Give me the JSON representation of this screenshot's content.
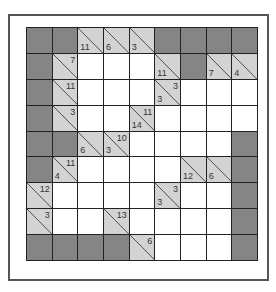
{
  "puzzle": {
    "type": "kakuro",
    "rows": 9,
    "cols": 9,
    "colors": {
      "dark": "#858585",
      "clue": "#d3d3d3",
      "white": "#ffffff",
      "lines": "#222222"
    },
    "grid": [
      [
        {
          "t": "D"
        },
        {
          "t": "D"
        },
        {
          "t": "C",
          "d": "11"
        },
        {
          "t": "C",
          "d": "6"
        },
        {
          "t": "C",
          "d": "3"
        },
        {
          "t": "D"
        },
        {
          "t": "D"
        },
        {
          "t": "D"
        },
        {
          "t": "D"
        }
      ],
      [
        {
          "t": "D"
        },
        {
          "t": "C",
          "r": "7"
        },
        {
          "t": "W"
        },
        {
          "t": "W"
        },
        {
          "t": "W"
        },
        {
          "t": "C",
          "d": "11"
        },
        {
          "t": "D"
        },
        {
          "t": "C",
          "d": "7"
        },
        {
          "t": "C",
          "d": "4"
        }
      ],
      [
        {
          "t": "D"
        },
        {
          "t": "C",
          "r": "11"
        },
        {
          "t": "W"
        },
        {
          "t": "W"
        },
        {
          "t": "W"
        },
        {
          "t": "C",
          "d": "3",
          "r": "3"
        },
        {
          "t": "W"
        },
        {
          "t": "W"
        },
        {
          "t": "W"
        }
      ],
      [
        {
          "t": "D"
        },
        {
          "t": "C",
          "r": "3"
        },
        {
          "t": "W"
        },
        {
          "t": "W"
        },
        {
          "t": "C",
          "d": "14",
          "r": "11"
        },
        {
          "t": "W"
        },
        {
          "t": "W"
        },
        {
          "t": "W"
        },
        {
          "t": "W"
        }
      ],
      [
        {
          "t": "D"
        },
        {
          "t": "D"
        },
        {
          "t": "C",
          "d": "6"
        },
        {
          "t": "C",
          "d": "3",
          "r": "10"
        },
        {
          "t": "W"
        },
        {
          "t": "W"
        },
        {
          "t": "W"
        },
        {
          "t": "W"
        },
        {
          "t": "D"
        }
      ],
      [
        {
          "t": "D"
        },
        {
          "t": "C",
          "d": "4",
          "r": "11"
        },
        {
          "t": "W"
        },
        {
          "t": "W"
        },
        {
          "t": "W"
        },
        {
          "t": "W"
        },
        {
          "t": "C",
          "d": "12"
        },
        {
          "t": "C",
          "d": "6"
        },
        {
          "t": "D"
        }
      ],
      [
        {
          "t": "C",
          "r": "12"
        },
        {
          "t": "W"
        },
        {
          "t": "W"
        },
        {
          "t": "W"
        },
        {
          "t": "W"
        },
        {
          "t": "C",
          "d": "3",
          "r": "3"
        },
        {
          "t": "W"
        },
        {
          "t": "W"
        },
        {
          "t": "D"
        }
      ],
      [
        {
          "t": "C",
          "r": "3"
        },
        {
          "t": "W"
        },
        {
          "t": "W"
        },
        {
          "t": "C",
          "r": "13"
        },
        {
          "t": "W"
        },
        {
          "t": "W"
        },
        {
          "t": "W"
        },
        {
          "t": "W"
        },
        {
          "t": "D"
        }
      ],
      [
        {
          "t": "D"
        },
        {
          "t": "D"
        },
        {
          "t": "D"
        },
        {
          "t": "D"
        },
        {
          "t": "C",
          "r": "6"
        },
        {
          "t": "W"
        },
        {
          "t": "W"
        },
        {
          "t": "W"
        },
        {
          "t": "D"
        }
      ]
    ]
  }
}
